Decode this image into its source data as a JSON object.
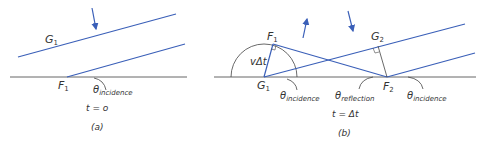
{
  "colors": {
    "wave": "#3a5fb8",
    "surface": "#666666",
    "text": "#333333",
    "arc": "#444444"
  },
  "panel_a": {
    "label_G": "G",
    "label_G_sub": "1",
    "label_F": "F",
    "label_F_sub": "1",
    "theta": "θ",
    "theta_sub": "incidence",
    "time": "t = o",
    "caption": "(a)"
  },
  "panel_b": {
    "label_F1": "F",
    "label_F1_sub": "1",
    "label_G1": "G",
    "label_G1_sub": "1",
    "label_G2": "G",
    "label_G2_sub": "2",
    "label_F2": "F",
    "label_F2_sub": "2",
    "vdt": "vΔt",
    "theta_left": "θ",
    "theta_left_sub": "incidence",
    "theta_mid": "θ",
    "theta_mid_sub": "reflection",
    "theta_right": "θ",
    "theta_right_sub": "incidence",
    "time": "t = Δt",
    "caption": "(b)"
  }
}
